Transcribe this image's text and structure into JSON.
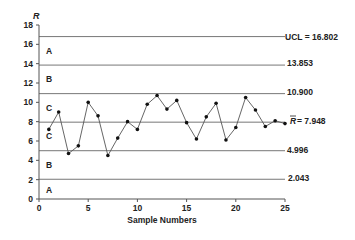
{
  "chart_data": {
    "type": "line",
    "title": "",
    "xlabel": "Sample Numbers",
    "ylabel": "R",
    "xlim": [
      0,
      25
    ],
    "ylim": [
      0,
      18
    ],
    "x_ticks": [
      0,
      5,
      10,
      15,
      20,
      25
    ],
    "y_ticks": [
      0,
      2,
      4,
      6,
      8,
      10,
      12,
      14,
      16,
      18
    ],
    "grid": false,
    "legend": null,
    "series": [
      {
        "name": "R",
        "x": [
          1,
          2,
          3,
          4,
          5,
          6,
          7,
          8,
          9,
          10,
          11,
          12,
          13,
          14,
          15,
          16,
          17,
          18,
          19,
          20,
          21,
          22,
          23,
          24,
          25
        ],
        "values": [
          7.2,
          9.0,
          4.7,
          5.5,
          10.0,
          8.6,
          4.5,
          6.3,
          8.0,
          7.2,
          9.8,
          10.7,
          9.3,
          10.2,
          7.9,
          6.2,
          8.5,
          9.9,
          6.1,
          7.4,
          10.5,
          9.2,
          7.5,
          8.1,
          7.8
        ]
      }
    ],
    "reference_lines": [
      {
        "name": "UCL",
        "value": 16.802,
        "label": "UCL = 16.802"
      },
      {
        "name": "upper-2sigma",
        "value": 13.853,
        "label": "13.853"
      },
      {
        "name": "upper-1sigma",
        "value": 10.9,
        "label": "10.900"
      },
      {
        "name": "center",
        "value": 7.948,
        "label": "R̄ = 7.948"
      },
      {
        "name": "lower-1sigma",
        "value": 4.996,
        "label": "4.996"
      },
      {
        "name": "lower-2sigma",
        "value": 2.043,
        "label": "2.043"
      }
    ],
    "zone_labels": [
      {
        "label": "A",
        "y": 15.3
      },
      {
        "label": "B",
        "y": 12.4
      },
      {
        "label": "C",
        "y": 9.4
      },
      {
        "label": "C",
        "y": 6.5
      },
      {
        "label": "B",
        "y": 3.5
      },
      {
        "label": "A",
        "y": 0.9
      }
    ],
    "annotations": []
  },
  "labels": {
    "y_axis_title": "R",
    "x_axis_title": "Sample Numbers",
    "ucl": "UCL = 16.802",
    "l13853": "13.853",
    "l10900": "10.900",
    "center": "= 7.948",
    "center_symbol": "R",
    "l4996": "4.996",
    "l2043": "2.043"
  },
  "colors": {
    "line": "#555555",
    "marker": "#111111",
    "axis": "#555555",
    "reference": "#777777"
  }
}
